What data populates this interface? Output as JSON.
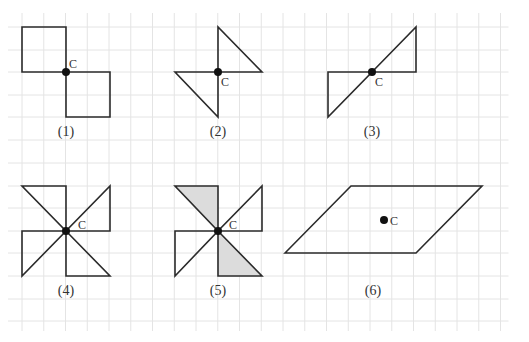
{
  "diagram": {
    "grid": {
      "x_start": 22,
      "x_step": 21.75,
      "x_count": 23,
      "y_lines": [
        5,
        27,
        50,
        72,
        95,
        117,
        140,
        163,
        186,
        208,
        231,
        253,
        276,
        299,
        321
      ],
      "color": "#e4e4e4"
    },
    "center_label": "C",
    "figures": [
      {
        "id": 1,
        "caption": "(1)",
        "center": [
          66,
          72
        ],
        "label_pos": [
          69,
          68
        ],
        "caption_pos": [
          66,
          136
        ],
        "polygons": [
          {
            "points": "22,27 66,27 66,72 22,72",
            "shaded": false
          },
          {
            "points": "66,72 110,72 110,117 66,117",
            "shaded": false
          }
        ]
      },
      {
        "id": 2,
        "caption": "(2)",
        "center": [
          218,
          72
        ],
        "label_pos": [
          221,
          86
        ],
        "caption_pos": [
          218,
          136
        ],
        "polygons": [
          {
            "points": "218,27 218,72 262,72",
            "shaded": false
          },
          {
            "points": "175,72 218,72 218,117",
            "shaded": false
          }
        ]
      },
      {
        "id": 3,
        "caption": "(3)",
        "center": [
          372,
          72
        ],
        "label_pos": [
          375,
          86
        ],
        "caption_pos": [
          372,
          136
        ],
        "polygons": [
          {
            "points": "372,72 416,27 416,72",
            "shaded": false
          },
          {
            "points": "328,72 372,72 328,117",
            "shaded": false
          }
        ]
      },
      {
        "id": 4,
        "caption": "(4)",
        "center": [
          66,
          231
        ],
        "label_pos": [
          78,
          229
        ],
        "caption_pos": [
          66,
          295
        ],
        "polygons": [
          {
            "points": "22,186 66,186 66,231",
            "shaded": false
          },
          {
            "points": "110,186 110,231 66,231",
            "shaded": false
          },
          {
            "points": "66,231 110,276 66,276",
            "shaded": false
          },
          {
            "points": "22,231 66,231 22,276",
            "shaded": false
          }
        ]
      },
      {
        "id": 5,
        "caption": "(5)",
        "center": [
          218,
          231
        ],
        "label_pos": [
          229,
          229
        ],
        "caption_pos": [
          218,
          295
        ],
        "polygons": [
          {
            "points": "175,186 218,186 218,231",
            "shaded": true
          },
          {
            "points": "262,186 262,231 218,231",
            "shaded": false
          },
          {
            "points": "218,231 262,276 218,276",
            "shaded": true
          },
          {
            "points": "175,231 218,231 175,276",
            "shaded": false
          }
        ]
      },
      {
        "id": 6,
        "caption": "(6)",
        "center": [
          384,
          220
        ],
        "label_pos": [
          390,
          225
        ],
        "caption_pos": [
          373,
          295
        ],
        "polygons": [
          {
            "points": "285,253 351,186 482,186 416,253",
            "shaded": false
          }
        ]
      }
    ]
  }
}
